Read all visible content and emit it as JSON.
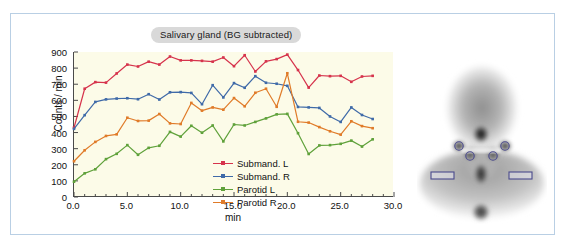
{
  "figure": {
    "panel_left_name": "time-activity-curve-panel",
    "panel_right_name": "scintigram-panel"
  },
  "chart_data": {
    "type": "line",
    "title": "Salivary gland (BG subtracted)",
    "xlabel": "min",
    "ylabel": "Counts / min",
    "xlim": [
      0.0,
      30.0
    ],
    "ylim": [
      0,
      900
    ],
    "xticks": [
      "0.0",
      "5.0",
      "10.0",
      "15.0",
      "20.0",
      "25.0",
      "30.0"
    ],
    "yticks": [
      "0",
      "100",
      "200",
      "300",
      "400",
      "500",
      "600",
      "700",
      "800",
      "900"
    ],
    "grid": false,
    "legend_position": "center-right-inside",
    "x": [
      0,
      1,
      2,
      3,
      4,
      5,
      6,
      7,
      8,
      9,
      10,
      11,
      12,
      13,
      14,
      15,
      16,
      17,
      18,
      19,
      20,
      21,
      22,
      23,
      24,
      25,
      26,
      27,
      28
    ],
    "series": [
      {
        "name": "Submand. L",
        "color": "#d6334c",
        "values": [
          430,
          672,
          713,
          710,
          767,
          822,
          810,
          840,
          822,
          872,
          848,
          848,
          845,
          840,
          866,
          812,
          880,
          779,
          842,
          856,
          884,
          788,
          679,
          754,
          750,
          752,
          715,
          748,
          752
        ]
      },
      {
        "name": "Submand. R",
        "color": "#3f6aa8",
        "values": [
          423,
          508,
          590,
          606,
          611,
          613,
          607,
          638,
          605,
          650,
          651,
          646,
          576,
          694,
          618,
          707,
          678,
          750,
          709,
          703,
          690,
          559,
          556,
          553,
          500,
          466,
          556,
          509,
          484
        ]
      },
      {
        "name": "Parotid L",
        "color": "#5fa13a",
        "values": [
          95,
          147,
          172,
          235,
          268,
          322,
          262,
          305,
          318,
          404,
          375,
          442,
          399,
          444,
          345,
          450,
          444,
          466,
          488,
          513,
          516,
          396,
          267,
          320,
          322,
          330,
          350,
          313,
          358
        ]
      },
      {
        "name": "Parotid R",
        "color": "#e07b29",
        "values": [
          222,
          290,
          342,
          379,
          389,
          492,
          472,
          474,
          515,
          457,
          453,
          584,
          536,
          556,
          542,
          614,
          563,
          647,
          672,
          560,
          768,
          467,
          462,
          434,
          408,
          387,
          470,
          440,
          427
        ]
      }
    ]
  },
  "legend": {
    "items": [
      {
        "label": "Submand. L",
        "color": "#d6334c"
      },
      {
        "label": "Submand. R",
        "color": "#3f6aa8"
      },
      {
        "label": "Parotid L",
        "color": "#5fa13a"
      },
      {
        "label": "Parotid R",
        "color": "#e07b29"
      }
    ]
  },
  "scintigram": {
    "description": "anterior head and neck scintigram",
    "roi_circles": [
      {
        "name": "parotid-right-roi"
      },
      {
        "name": "parotid-left-roi"
      },
      {
        "name": "submandibular-right-roi"
      },
      {
        "name": "submandibular-left-roi"
      }
    ],
    "roi_rects": [
      {
        "name": "background-roi-right"
      },
      {
        "name": "background-roi-left"
      }
    ],
    "roi_color": "#4a4a8c"
  }
}
